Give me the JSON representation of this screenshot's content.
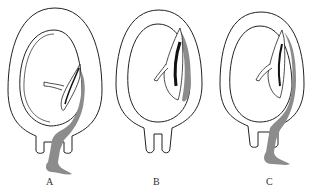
{
  "diagram": {
    "panels": [
      {
        "label": "A",
        "hemorrhage": "revealed"
      },
      {
        "label": "B",
        "hemorrhage": "concealed"
      },
      {
        "label": "C",
        "hemorrhage": "mixed"
      }
    ],
    "colors": {
      "outline": "#222222",
      "blood": "#8c8c8c",
      "clot": "#111111",
      "background": "#ffffff"
    }
  }
}
